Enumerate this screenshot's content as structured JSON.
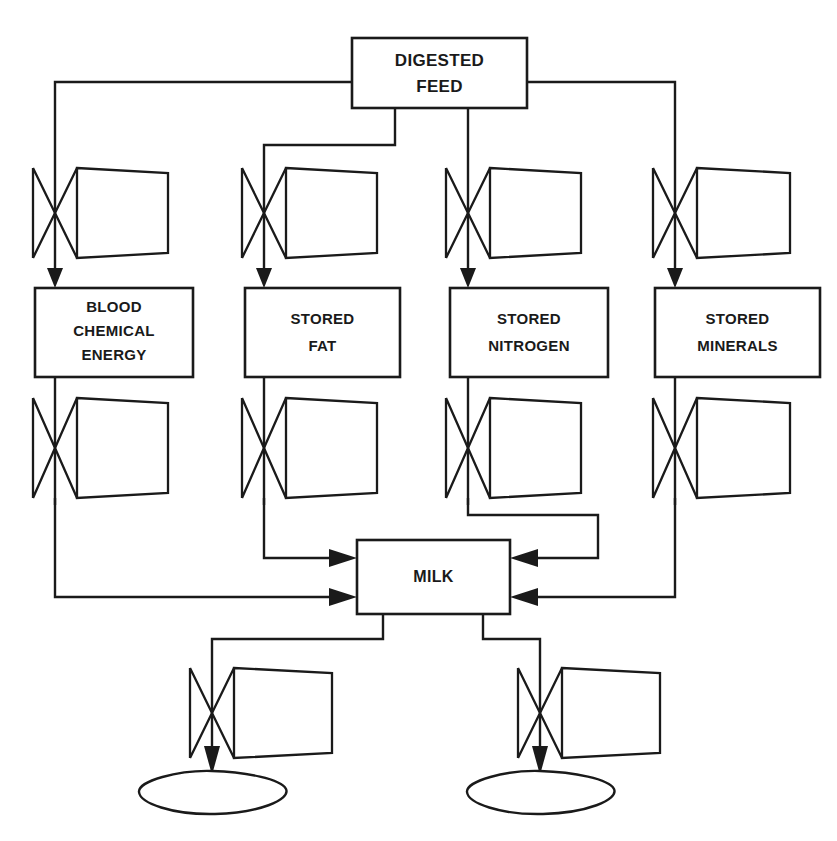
{
  "diagram": {
    "type": "stock-and-flow",
    "colors": {
      "ink": "#1a1a1a",
      "paper": "#ffffff"
    },
    "stocks": [
      {
        "id": "digested-feed",
        "lines": [
          "DIGESTED",
          "FEED"
        ],
        "x": 352,
        "y": 38,
        "w": 175,
        "h": 70,
        "font_size": 17
      },
      {
        "id": "blood-chemical-energy",
        "lines": [
          "BLOOD",
          "CHEMICAL",
          "ENERGY"
        ],
        "x": 35,
        "y": 288,
        "w": 158,
        "h": 89,
        "font_size": 15
      },
      {
        "id": "stored-fat",
        "lines": [
          "STORED",
          "FAT"
        ],
        "x": 245,
        "y": 288,
        "w": 155,
        "h": 89,
        "font_size": 15
      },
      {
        "id": "stored-nitrogen",
        "lines": [
          "STORED",
          "NITROGEN"
        ],
        "x": 450,
        "y": 288,
        "w": 158,
        "h": 89,
        "font_size": 15
      },
      {
        "id": "stored-minerals",
        "lines": [
          "STORED",
          "MINERALS"
        ],
        "x": 655,
        "y": 288,
        "w": 165,
        "h": 89,
        "font_size": 15
      },
      {
        "id": "milk",
        "lines": [
          "MILK"
        ],
        "x": 357,
        "y": 540,
        "w": 153,
        "h": 74,
        "font_size": 16
      }
    ],
    "flow_valves": [
      {
        "id": "valve-to-blood-chemical-energy",
        "stem_x": 55,
        "top": 168,
        "bottom": 258
      },
      {
        "id": "valve-to-stored-fat",
        "stem_x": 264,
        "top": 168,
        "bottom": 258
      },
      {
        "id": "valve-to-stored-nitrogen",
        "stem_x": 468,
        "top": 168,
        "bottom": 258
      },
      {
        "id": "valve-to-stored-minerals",
        "stem_x": 675,
        "top": 168,
        "bottom": 258
      },
      {
        "id": "valve-blood-chemical-energy-to-milk",
        "stem_x": 55,
        "top": 398,
        "bottom": 498
      },
      {
        "id": "valve-stored-fat-to-milk",
        "stem_x": 264,
        "top": 398,
        "bottom": 498
      },
      {
        "id": "valve-stored-nitrogen-to-milk",
        "stem_x": 468,
        "top": 398,
        "bottom": 498
      },
      {
        "id": "valve-stored-minerals-to-milk",
        "stem_x": 675,
        "top": 398,
        "bottom": 498
      },
      {
        "id": "valve-milk-out-left",
        "stem_x": 212,
        "top": 668,
        "bottom": 758
      },
      {
        "id": "valve-milk-out-right",
        "stem_x": 540,
        "top": 668,
        "bottom": 758
      }
    ],
    "sinks": [
      {
        "id": "sink-left",
        "cx": 212,
        "cy": 791
      },
      {
        "id": "sink-right",
        "cx": 540,
        "cy": 791
      }
    ],
    "connections": [
      {
        "id": "feed-to-blood-chemical-energy",
        "label": "DIGESTED FEED to BLOOD CHEMICAL ENERGY"
      },
      {
        "id": "feed-to-stored-fat",
        "label": "DIGESTED FEED to STORED FAT"
      },
      {
        "id": "feed-to-stored-nitrogen",
        "label": "DIGESTED FEED to STORED NITROGEN"
      },
      {
        "id": "feed-to-stored-minerals",
        "label": "DIGESTED FEED to STORED MINERALS"
      },
      {
        "id": "blood-chemical-energy-to-milk",
        "label": "BLOOD CHEMICAL ENERGY to MILK"
      },
      {
        "id": "stored-fat-to-milk",
        "label": "STORED FAT to MILK"
      },
      {
        "id": "stored-nitrogen-to-milk",
        "label": "STORED NITROGEN to MILK"
      },
      {
        "id": "stored-minerals-to-milk",
        "label": "STORED MINERALS to MILK"
      },
      {
        "id": "milk-to-sink-left",
        "label": "MILK to left sink"
      },
      {
        "id": "milk-to-sink-right",
        "label": "MILK to right sink"
      }
    ]
  }
}
